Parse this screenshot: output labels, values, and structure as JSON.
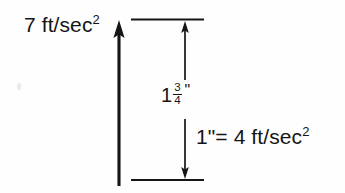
{
  "diagram": {
    "background_color": "#fefefe",
    "ink_color": "#151515",
    "labels": {
      "magnitude": {
        "base": "7 ft/sec",
        "exponent": "2",
        "full_text": "7 ft/sec2"
      },
      "dimension": {
        "whole": "1",
        "numerator": "3",
        "denominator": "4",
        "unit_mark": "\"",
        "full_text": "1 3/4\""
      },
      "scale_key": {
        "base": "1\"= 4 ft/sec",
        "exponent": "2",
        "full_text": "1\"= 4 ft/sec2"
      }
    },
    "geometry": {
      "main_vector": {
        "name": "acceleration-vector-arrow",
        "x": 119,
        "y_top": 21,
        "y_bottom": 186,
        "stroke_width": 3,
        "arrowhead": "up"
      },
      "extension_line_top": {
        "y": 19,
        "x_start": 131,
        "x_end": 204,
        "stroke_width": 2
      },
      "extension_line_bottom": {
        "y": 180,
        "x_start": 131,
        "x_end": 204,
        "stroke_width": 2
      },
      "dimension_arrow": {
        "name": "dimension-measure-arrow",
        "x": 185,
        "y_top": 21,
        "y_bottom": 179,
        "gap_top": 80,
        "gap_bottom": 119,
        "stroke_width": 1.6,
        "arrowhead": "both"
      }
    }
  }
}
